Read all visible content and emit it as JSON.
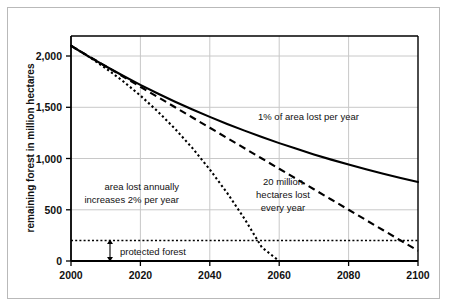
{
  "chart_data": {
    "type": "line",
    "title": "",
    "xlabel": "",
    "ylabel": "remaining forest in million hectares",
    "xlim": [
      2000,
      2100
    ],
    "ylim": [
      0,
      2150
    ],
    "grid": true,
    "legend_position": "inline-annotations",
    "x_ticks": [
      "2000",
      "2020",
      "2040",
      "2060",
      "2080",
      "2100"
    ],
    "x_tick_values": [
      2000,
      2020,
      2040,
      2060,
      2080,
      2100
    ],
    "y_ticks": [
      "0",
      "500",
      "1,000",
      "1,500",
      "2,000"
    ],
    "y_tick_values": [
      0,
      500,
      1000,
      1500,
      2000
    ],
    "x": [
      2000,
      2005,
      2010,
      2015,
      2020,
      2025,
      2030,
      2035,
      2040,
      2045,
      2050,
      2055,
      2060,
      2065,
      2070,
      2075,
      2080,
      2085,
      2090,
      2095,
      2100
    ],
    "series": [
      {
        "name": "1% of area lost per year",
        "style": "solid",
        "color": "#000000",
        "values": [
          2100,
          1997,
          1900,
          1807,
          1718,
          1634,
          1554,
          1478,
          1406,
          1337,
          1272,
          1209,
          1150,
          1094,
          1040,
          989,
          941,
          895,
          851,
          809,
          770
        ]
      },
      {
        "name": "20 million hectares lost every year",
        "style": "dashed",
        "color": "#000000",
        "values": [
          2100,
          2000,
          1900,
          1800,
          1700,
          1600,
          1500,
          1400,
          1300,
          1200,
          1100,
          1000,
          900,
          800,
          700,
          600,
          500,
          400,
          300,
          200,
          100
        ]
      },
      {
        "name": "area lost annually increases 2% per year",
        "style": "dotted",
        "color": "#000000",
        "values": [
          2100,
          1996,
          1881,
          1754,
          1614,
          1459,
          1289,
          1101,
          893,
          664,
          412,
          133,
          0,
          0,
          0,
          0,
          0,
          0,
          0,
          0,
          0
        ]
      },
      {
        "name": "protected forest",
        "style": "dotted-horizontal",
        "color": "#000000",
        "values": [
          200,
          200,
          200,
          200,
          200,
          200,
          200,
          200,
          200,
          200,
          200,
          200,
          200,
          200,
          200,
          200,
          200,
          200,
          200,
          200,
          200
        ]
      }
    ],
    "annotations": [
      {
        "id": "solid-label",
        "text": "1% of area lost per year",
        "lines": [
          "1% of area lost per year"
        ],
        "x": 2060,
        "y": 1430
      },
      {
        "id": "dotted-label",
        "text": "area lost annually increases 2% per year",
        "lines": [
          "area lost annually",
          "increases 2% per year"
        ],
        "x": 2026,
        "y": 660
      },
      {
        "id": "dashed-label",
        "text": "20 million hectares lost every year",
        "lines": [
          "20 million",
          "hectares lost",
          "every year"
        ],
        "x": 2049,
        "y": 640
      },
      {
        "id": "protected-label",
        "text": "protected forest",
        "lines": [
          "protected forest"
        ],
        "x": 2016,
        "y": 110
      }
    ]
  },
  "axis": {
    "y_title": "remaining forest in million hectares",
    "y_labels": [
      "2,000",
      "1,500",
      "1,000",
      "500",
      "0"
    ],
    "x_labels": [
      "2000",
      "2020",
      "2040",
      "2060",
      "2080",
      "2100"
    ]
  },
  "labels": {
    "solid_curve": "1% of area lost per year",
    "dotted_curve_line1": "area lost annually",
    "dotted_curve_line2": "increases 2% per year",
    "dashed_curve_line1": "20 million",
    "dashed_curve_line2": "hectares lost",
    "dashed_curve_line3": "every year",
    "protected_forest": "protected forest"
  },
  "colors": {
    "curve": "#000000",
    "grid": "#c8c8c8",
    "axis": "#000000",
    "frame": "#b9b9b9",
    "background": "#ffffff"
  }
}
